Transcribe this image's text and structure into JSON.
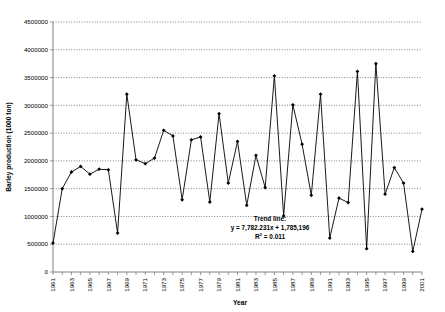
{
  "chart_data": {
    "type": "line",
    "title": "",
    "xlabel": "Year",
    "ylabel": "Barley production (1000 ton)",
    "xlim": [
      1961,
      2001
    ],
    "ylim": [
      0,
      4500000
    ],
    "ytick_step": 500000,
    "grid": true,
    "legend": false,
    "marker": "diamond",
    "series_color": "#000000",
    "trend_color": "#000000",
    "x": [
      1961,
      1962,
      1963,
      1964,
      1965,
      1966,
      1967,
      1968,
      1969,
      1970,
      1971,
      1972,
      1973,
      1974,
      1975,
      1976,
      1977,
      1978,
      1979,
      1980,
      1981,
      1982,
      1983,
      1984,
      1985,
      1986,
      1987,
      1988,
      1989,
      1990,
      1991,
      1992,
      1993,
      1994,
      1995,
      1996,
      1997,
      1998,
      1999,
      2000,
      2001
    ],
    "values": [
      520000,
      1500000,
      1800000,
      1900000,
      1760000,
      1850000,
      1840000,
      700000,
      3200000,
      2020000,
      1950000,
      2050000,
      2550000,
      2450000,
      1300000,
      2380000,
      2430000,
      1260000,
      2850000,
      1600000,
      2350000,
      1200000,
      2100000,
      1520000,
      3530000,
      1010000,
      3010000,
      2300000,
      1380000,
      3200000,
      610000,
      1330000,
      1250000,
      3610000,
      420000,
      3750000,
      1400000,
      1880000,
      1600000,
      370000,
      1130000
    ],
    "ytick_labels": [
      "0",
      "500000",
      "1000000",
      "1500000",
      "2000000",
      "2500000",
      "3000000",
      "3500000",
      "4000000",
      "4500000"
    ],
    "ytick_values": [
      0,
      500000,
      1000000,
      1500000,
      2000000,
      2500000,
      3000000,
      3500000,
      4000000,
      4500000
    ],
    "xtick_labels": [
      "1961",
      "1963",
      "1965",
      "1967",
      "1969",
      "1971",
      "1973",
      "1975",
      "1977",
      "1979",
      "1981",
      "1983",
      "1985",
      "1987",
      "1989",
      "1991",
      "1993",
      "1995",
      "1997",
      "1999",
      "2001"
    ],
    "xtick_values": [
      1961,
      1963,
      1965,
      1967,
      1969,
      1971,
      1973,
      1975,
      1977,
      1979,
      1981,
      1983,
      1985,
      1987,
      1989,
      1991,
      1993,
      1995,
      1997,
      1999,
      2001
    ],
    "trendline": {
      "label": "Trend line:",
      "equation": "y = 7,782.231x + 1,785,196",
      "r2_prefix": "R",
      "r2_exponent": "2",
      "r2_value": " = 0.011",
      "slope": 7782.231,
      "intercept": 1785196,
      "r2": 0.011
    },
    "annotations": [
      "Trend line:",
      "y = 7,782.231x + 1,785,196",
      "R2 = 0.011"
    ]
  }
}
